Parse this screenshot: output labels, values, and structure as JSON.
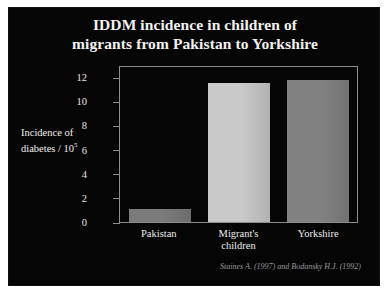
{
  "slide": {
    "background_color": "#050505",
    "frame_color": "#ffffff",
    "text_color": "#f2f2f2"
  },
  "title": {
    "line1": "IDDM incidence in children of",
    "line2": "migrants from Pakistan to Yorkshire"
  },
  "axis": {
    "y_title_line1": "Incidence of",
    "y_title_line2_prefix": "diabetes / 10",
    "y_title_exponent": "5"
  },
  "citation": "Staines A. (1997) and Bodansky H.J. (1992)",
  "chart_data": {
    "type": "bar",
    "title": "IDDM incidence in children of migrants from Pakistan to Yorkshire",
    "xlabel": "",
    "ylabel": "Incidence of diabetes / 10^5",
    "categories": [
      "Pakistan",
      "Migrant's children",
      "Yorkshire"
    ],
    "category_lines": [
      [
        "Pakistan"
      ],
      [
        "Migrant's",
        "children"
      ],
      [
        "Yorkshire"
      ]
    ],
    "values": [
      1.1,
      11.7,
      11.9
    ],
    "ylim": [
      0,
      13
    ],
    "yticks": [
      0,
      2,
      4,
      6,
      8,
      10,
      12
    ],
    "ytick_labels": [
      "0",
      "2",
      "4",
      "6",
      "8",
      "10",
      "12"
    ],
    "grid": false,
    "legend": "none",
    "bar_colors": [
      "#7b7b7b",
      "#c9c9c9",
      "#828282"
    ],
    "source": "Staines A. (1997) and Bodansky H.J. (1992)"
  }
}
